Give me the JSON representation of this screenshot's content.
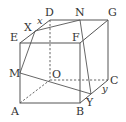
{
  "diagram": {
    "type": "cube-with-section",
    "vertices": {
      "A": {
        "label": "A",
        "x": 20,
        "y": 103
      },
      "B": {
        "label": "B",
        "x": 80,
        "y": 103
      },
      "C": {
        "label": "C",
        "x": 108,
        "y": 80
      },
      "O": {
        "label": "O",
        "x": 50,
        "y": 80
      },
      "E": {
        "label": "E",
        "x": 20,
        "y": 43
      },
      "F": {
        "label": "F",
        "x": 80,
        "y": 43
      },
      "G": {
        "label": "G",
        "x": 108,
        "y": 20
      },
      "D": {
        "label": "D",
        "x": 50,
        "y": 20
      }
    },
    "points": {
      "X": {
        "label": "X",
        "x": 35,
        "y": 31
      },
      "N": {
        "label": "N",
        "x": 80,
        "y": 20
      },
      "M": {
        "label": "M",
        "x": 20,
        "y": 73
      },
      "Y": {
        "label": "Y",
        "x": 91,
        "y": 94
      }
    },
    "variables": {
      "x": "x",
      "y": "y"
    },
    "edges_solid": [
      [
        "A",
        "B"
      ],
      [
        "B",
        "F"
      ],
      [
        "F",
        "E"
      ],
      [
        "E",
        "A"
      ],
      [
        "E",
        "D"
      ],
      [
        "D",
        "G"
      ],
      [
        "G",
        "F"
      ],
      [
        "G",
        "C"
      ],
      [
        "C",
        "B"
      ]
    ],
    "edges_hidden": [
      [
        "D",
        "O"
      ],
      [
        "O",
        "C"
      ],
      [
        "A",
        "O"
      ]
    ],
    "auxiliary_lines": [
      [
        "X",
        "N"
      ],
      [
        "X",
        "M"
      ],
      [
        "M",
        "Y"
      ],
      [
        "N",
        "Y"
      ]
    ]
  }
}
